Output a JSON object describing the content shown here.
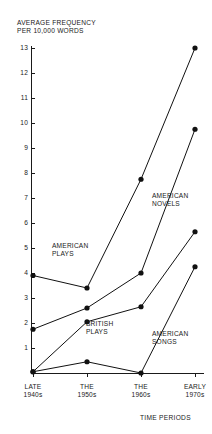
{
  "chart_data": {
    "type": "line",
    "title": "AVERAGE FREQUENCY\nPER 10,000 WORDS",
    "ylabel": "AVERAGE FREQUENCY PER 10,000 WORDS",
    "xlabel": "TIME PERIODS",
    "categories": [
      "LATE\n1940s",
      "THE\n1950s",
      "THE\n1960s",
      "EARLY\n1970s"
    ],
    "category_labels": [
      "LATE 1940s",
      "THE 1950s",
      "THE 1960s",
      "EARLY 1970s"
    ],
    "ylim": [
      0,
      13
    ],
    "yticks": [
      1,
      2,
      3,
      4,
      5,
      6,
      7,
      8,
      9,
      10,
      11,
      12,
      13
    ],
    "ytick_labels": [
      "1",
      "2",
      "3",
      "4",
      "5",
      "6",
      "7",
      "8",
      "9",
      "10",
      "11",
      "12",
      "13"
    ],
    "grid": false,
    "legend": "inline-annotations",
    "marker": "filled-circle",
    "line_color": "#111111",
    "series": [
      {
        "name": "AMERICAN\nPLAYS",
        "label": "AMERICAN PLAYS",
        "values": [
          3.9,
          3.4,
          7.75,
          13.0
        ]
      },
      {
        "name": "AMERICAN\nNOVELS",
        "label": "AMERICAN NOVELS",
        "values": [
          1.75,
          2.6,
          4.0,
          9.75
        ]
      },
      {
        "name": "BRITISH\nPLAYS",
        "label": "BRITISH PLAYS",
        "values": [
          0.05,
          2.05,
          2.65,
          5.65
        ]
      },
      {
        "name": "AMERICAN\nSONGS",
        "label": "AMERICAN SONGS",
        "values": [
          0.05,
          0.45,
          0.0,
          4.25
        ]
      }
    ]
  }
}
